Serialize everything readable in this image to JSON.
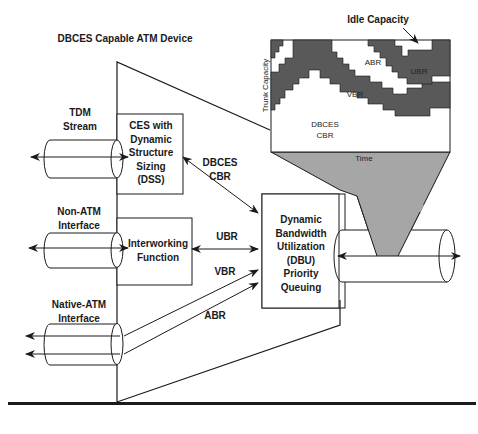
{
  "title": "DBCES Capable ATM Device",
  "interfaces": {
    "tdm": "TDM\nStream",
    "non_atm": "Non-ATM\nInterface",
    "native_atm": "Native-ATM\nInterface"
  },
  "blocks": {
    "ces": "CES with\nDynamic\nStructure\nSizing\n(DSS)",
    "interworking": "Interworking\nFunction",
    "dbu": "Dynamic\nBandwidth\nUtilization\n(DBU)\nPriority\nQueuing"
  },
  "flows": {
    "dbces_cbr": "DBCES\nCBR",
    "ubr": "UBR",
    "vbr": "VBR",
    "abr": "ABR"
  },
  "chart": {
    "idle_label": "Idle Capacity",
    "y_axis": "Trunk Capacity",
    "x_axis": "Time",
    "regions": {
      "abr": "ABR",
      "ubr": "UBR",
      "vbr": "VBR",
      "cbr": "DBCES\nCBR"
    }
  },
  "colors": {
    "dark_fill": "#595959",
    "funnel_fill": "#a6a6a6",
    "stroke": "#1a1a1a"
  }
}
